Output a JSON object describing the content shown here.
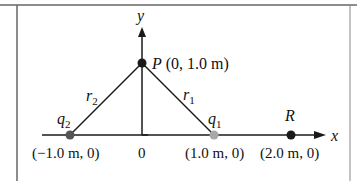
{
  "diagram": {
    "axes": {
      "x_label": "x",
      "y_label": "y",
      "origin_label": "0"
    },
    "points": {
      "P": {
        "name": "P",
        "coords": "(0, 1.0 m)",
        "color": "#1a1a1a"
      },
      "q1": {
        "name": "q",
        "subscript": "1",
        "coords": "(1.0 m, 0)",
        "color": "#a8a8a8"
      },
      "q2": {
        "name": "q",
        "subscript": "2",
        "coords": "(−1.0 m, 0)",
        "color": "#555555"
      },
      "R": {
        "name": "R",
        "coords": "(2.0 m, 0)",
        "color": "#1a1a1a"
      }
    },
    "segments": {
      "r1": {
        "name": "r",
        "subscript": "1"
      },
      "r2": {
        "name": "r",
        "subscript": "2"
      }
    },
    "colors": {
      "line": "#1a1a1a",
      "border": "#555555",
      "background": "#ffffff"
    }
  }
}
